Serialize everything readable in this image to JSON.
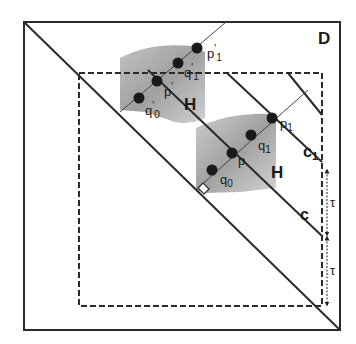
{
  "figure": {
    "domain_label": "D",
    "region_label_upper": "H",
    "region_label_lower": "H",
    "line_labels": {
      "c": "c",
      "c1": "c",
      "c1_sub": "1"
    },
    "points_upper": {
      "p_prime_1": {
        "base": "p",
        "mark": "'",
        "sub": "1"
      },
      "q_prime_1": {
        "base": "q",
        "mark": "'",
        "sub": "1"
      },
      "p_prime": {
        "base": "p",
        "mark": "'"
      },
      "q_prime_0": {
        "base": "q",
        "mark": "'",
        "sub": "0"
      }
    },
    "points_lower": {
      "p1": {
        "base": "p",
        "sub": "1"
      },
      "q1": {
        "base": "q",
        "sub": "1"
      },
      "p": {
        "base": "p"
      },
      "q0": {
        "base": "q",
        "sub": "0"
      }
    },
    "tau_labels": [
      "τ",
      "τ"
    ],
    "colors": {
      "line": "#2a2a2a",
      "shade_dark": "#9a9a9a",
      "shade_light": "#cfcfcf",
      "point": "#1a1a1a"
    }
  }
}
